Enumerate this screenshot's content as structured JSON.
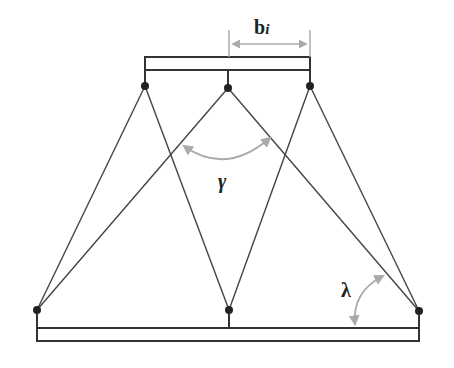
{
  "diagram": {
    "type": "truss-platform",
    "labels": {
      "b_main": "b",
      "b_sub": "i",
      "gamma": "γ",
      "lambda": "λ"
    },
    "colors": {
      "line": "#333333",
      "annotation": "#aaaaaa",
      "background": "#ffffff"
    },
    "top_joints": [
      [
        145,
        86
      ],
      [
        228,
        88
      ],
      [
        310,
        86
      ]
    ],
    "bottom_joints": [
      [
        37,
        310
      ],
      [
        229,
        310
      ],
      [
        419,
        311
      ]
    ],
    "members": [
      [
        [
          145,
          86
        ],
        [
          37,
          310
        ]
      ],
      [
        [
          145,
          86
        ],
        [
          229,
          310
        ]
      ],
      [
        [
          228,
          88
        ],
        [
          37,
          310
        ]
      ],
      [
        [
          228,
          88
        ],
        [
          419,
          311
        ]
      ],
      [
        [
          310,
          86
        ],
        [
          229,
          310
        ]
      ],
      [
        [
          310,
          86
        ],
        [
          419,
          311
        ]
      ]
    ]
  }
}
